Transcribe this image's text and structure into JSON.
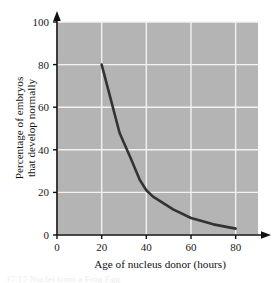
{
  "figure": {
    "background_color": "#ffffff",
    "plot_background_color": "#b4b4b4",
    "gridline_color": "#f2f2f2",
    "axis_color": "#111111",
    "series_color": "#333333",
    "partial_caption": "17.17   Nuclei from a Frog Egg"
  },
  "chart_data": {
    "type": "line",
    "title": "",
    "xlabel": "Age of nucleus donor (hours)",
    "ylabel": "Percentage of embryos that develop normally",
    "ylabel_line1": "Percentage of embryos",
    "ylabel_line2": "that develop normally",
    "xlim": [
      0,
      90
    ],
    "ylim": [
      0,
      100
    ],
    "xticks": [
      0,
      20,
      40,
      60,
      80
    ],
    "yticks": [
      0,
      20,
      40,
      60,
      80,
      100
    ],
    "xtick_labels": [
      "0",
      "20",
      "40",
      "60",
      "80"
    ],
    "ytick_labels": [
      "0",
      "20",
      "40",
      "60",
      "80",
      "100"
    ],
    "grid": true,
    "legend": "none",
    "series": [
      {
        "name": "Embryos developing normally",
        "color": "#333333",
        "x": [
          20,
          24,
          28,
          33,
          37,
          40,
          43,
          46,
          52,
          60,
          70,
          80
        ],
        "y": [
          80,
          64,
          48,
          36,
          26,
          21,
          18,
          16,
          12,
          8,
          5,
          3
        ]
      }
    ]
  }
}
